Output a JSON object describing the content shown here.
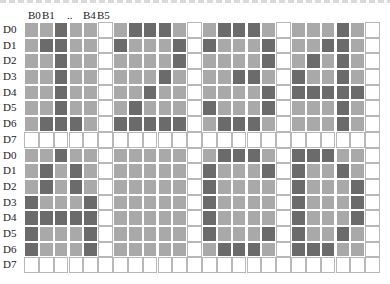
{
  "header": {
    "col_labels": [
      "B0",
      "B1",
      "..",
      "B4",
      "B5"
    ]
  },
  "row_labels": [
    "D0",
    "D1",
    "D2",
    "D3",
    "D4",
    "D5",
    "D6",
    "D7"
  ],
  "colors": {
    "mid": "#a9a9a9",
    "on": "#6b6b6b",
    "off": "#ffffff"
  },
  "grid": {
    "block_rows": 2,
    "block_cols": 4,
    "cell_cols_per_block": 6,
    "cell_rows_per_block": 8,
    "blocks": [
      {
        "glyph": "1",
        "on": [
          [
            2
          ],
          [
            1,
            2
          ],
          [
            2
          ],
          [
            2
          ],
          [
            2
          ],
          [
            2
          ],
          [
            1,
            2,
            3
          ]
        ]
      },
      {
        "glyph": "2",
        "on": [
          [
            1,
            2,
            3
          ],
          [
            0,
            4
          ],
          [
            4
          ],
          [
            3
          ],
          [
            2
          ],
          [
            1
          ],
          [
            0,
            1,
            2,
            3,
            4
          ]
        ]
      },
      {
        "glyph": "3",
        "on": [
          [
            1,
            2,
            3
          ],
          [
            0,
            4
          ],
          [
            4
          ],
          [
            2,
            3
          ],
          [
            4
          ],
          [
            0,
            4
          ],
          [
            1,
            2,
            3
          ]
        ]
      },
      {
        "glyph": "4",
        "on": [
          [
            3
          ],
          [
            2,
            3
          ],
          [
            1,
            3
          ],
          [
            0,
            3
          ],
          [
            0,
            1,
            2,
            3,
            4
          ],
          [
            3
          ],
          [
            3
          ]
        ]
      },
      {
        "glyph": "A",
        "on": [
          [
            2
          ],
          [
            1,
            3
          ],
          [
            1,
            3
          ],
          [
            0,
            4
          ],
          [
            0,
            1,
            2,
            3,
            4
          ],
          [
            0,
            4
          ],
          [
            0,
            4
          ]
        ]
      },
      {
        "glyph": " ",
        "on": [
          [],
          [],
          [],
          [],
          [],
          [],
          []
        ]
      },
      {
        "glyph": "C",
        "on": [
          [
            1,
            2,
            3
          ],
          [
            0,
            4
          ],
          [
            0
          ],
          [
            0
          ],
          [
            0
          ],
          [
            0,
            4
          ],
          [
            1,
            2,
            3
          ]
        ]
      },
      {
        "glyph": "D",
        "on": [
          [
            0,
            1,
            2
          ],
          [
            0,
            3
          ],
          [
            0,
            4
          ],
          [
            0,
            4
          ],
          [
            0,
            4
          ],
          [
            0,
            3
          ],
          [
            0,
            1,
            2
          ]
        ]
      }
    ]
  }
}
